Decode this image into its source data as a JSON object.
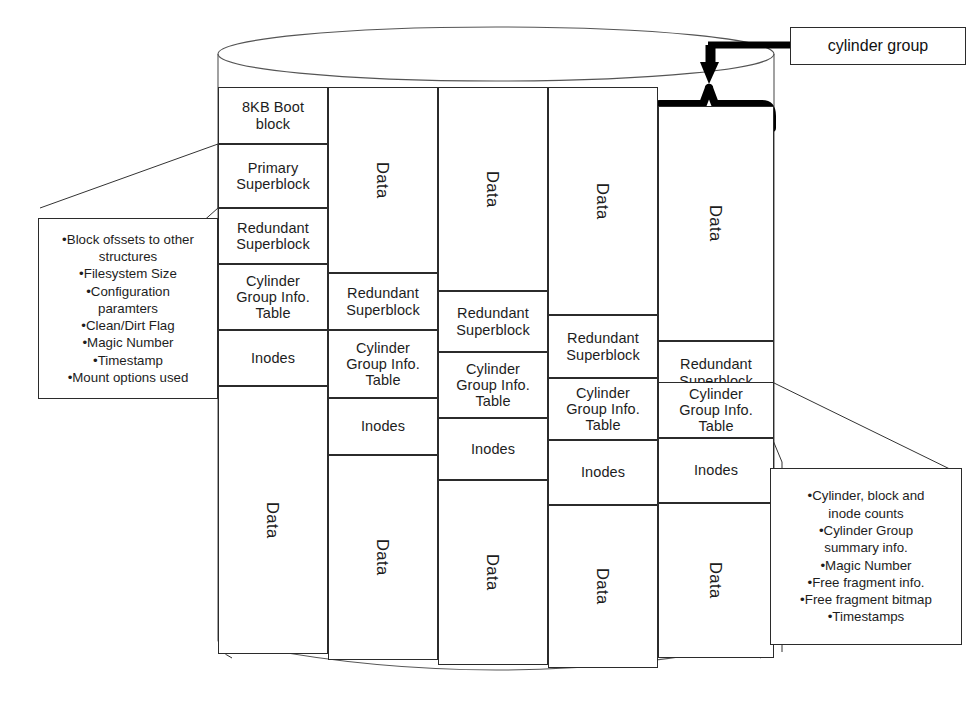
{
  "diagram": {
    "title_tag": "cylinder group",
    "boot_block_label": "8KB Boot\nblock",
    "labels": {
      "boot": "8KB Boot block",
      "primary_superblock": "Primary Superblock",
      "redundant_superblock": "Redundant Superblock",
      "cg_info_table": "Cylinder Group Info. Table",
      "inodes": "Inodes",
      "data": "Data"
    },
    "columns": [
      {
        "name": "column-1",
        "segments": [
          {
            "type": "boot",
            "line1": "8KB Boot",
            "line2": "block"
          },
          {
            "type": "primary",
            "line1": "Primary",
            "line2": "Superblock"
          },
          {
            "type": "redundant",
            "line1": "Redundant",
            "line2": "Superblock"
          },
          {
            "type": "cginfo",
            "line1": "Cylinder",
            "line2": "Group Info.",
            "line3": "Table"
          },
          {
            "type": "inodes",
            "line1": "Inodes"
          },
          {
            "type": "data",
            "line1": "Data"
          }
        ]
      },
      {
        "name": "column-2",
        "segments": [
          {
            "type": "data",
            "line1": "Data"
          },
          {
            "type": "redundant",
            "line1": "Redundant",
            "line2": "Superblock"
          },
          {
            "type": "cginfo",
            "line1": "Cylinder",
            "line2": "Group Info.",
            "line3": "Table"
          },
          {
            "type": "inodes",
            "line1": "Inodes"
          },
          {
            "type": "data",
            "line1": "Data"
          }
        ]
      },
      {
        "name": "column-3",
        "segments": [
          {
            "type": "data",
            "line1": "Data"
          },
          {
            "type": "redundant",
            "line1": "Redundant",
            "line2": "Superblock"
          },
          {
            "type": "cginfo",
            "line1": "Cylinder",
            "line2": "Group Info.",
            "line3": "Table"
          },
          {
            "type": "inodes",
            "line1": "Inodes"
          },
          {
            "type": "data",
            "line1": "Data"
          }
        ]
      },
      {
        "name": "column-4",
        "segments": [
          {
            "type": "data",
            "line1": "Data"
          },
          {
            "type": "redundant",
            "line1": "Redundant",
            "line2": "Superblock"
          },
          {
            "type": "cginfo",
            "line1": "Cylinder",
            "line2": "Group Info.",
            "line3": "Table"
          },
          {
            "type": "inodes",
            "line1": "Inodes"
          },
          {
            "type": "data",
            "line1": "Data"
          }
        ]
      },
      {
        "name": "column-5",
        "segments": [
          {
            "type": "data",
            "line1": "Data"
          },
          {
            "type": "redundant",
            "line1": "Redundant",
            "line2": "Superblock"
          },
          {
            "type": "cginfo",
            "line1": "Cylinder",
            "line2": "Group Info.",
            "line3": "Table"
          },
          {
            "type": "inodes",
            "line1": "Inodes"
          },
          {
            "type": "data",
            "line1": "Data"
          }
        ]
      }
    ],
    "superblock_callout": {
      "name": "superblock-contents-callout",
      "lines": [
        "•Block ofssets to other",
        "structures",
        "•Filesystem Size",
        "•Configuration",
        "paramters",
        "•Clean/Dirt Flag",
        "•Magic Number",
        "•Timestamp",
        "•Mount options used"
      ]
    },
    "cg_info_callout": {
      "name": "cylinder-group-info-callout",
      "lines": [
        "•Cylinder, block and",
        "inode counts",
        "•Cylinder Group",
        "summary info.",
        "•Magic Number",
        "•Free fragment info.",
        "•Free fragment bitmap",
        "•Timestamps"
      ]
    },
    "colors": {
      "stroke": "#2b2b2b",
      "thin_stroke": "#555555",
      "bracket": "#000000",
      "background": "#ffffff"
    }
  }
}
